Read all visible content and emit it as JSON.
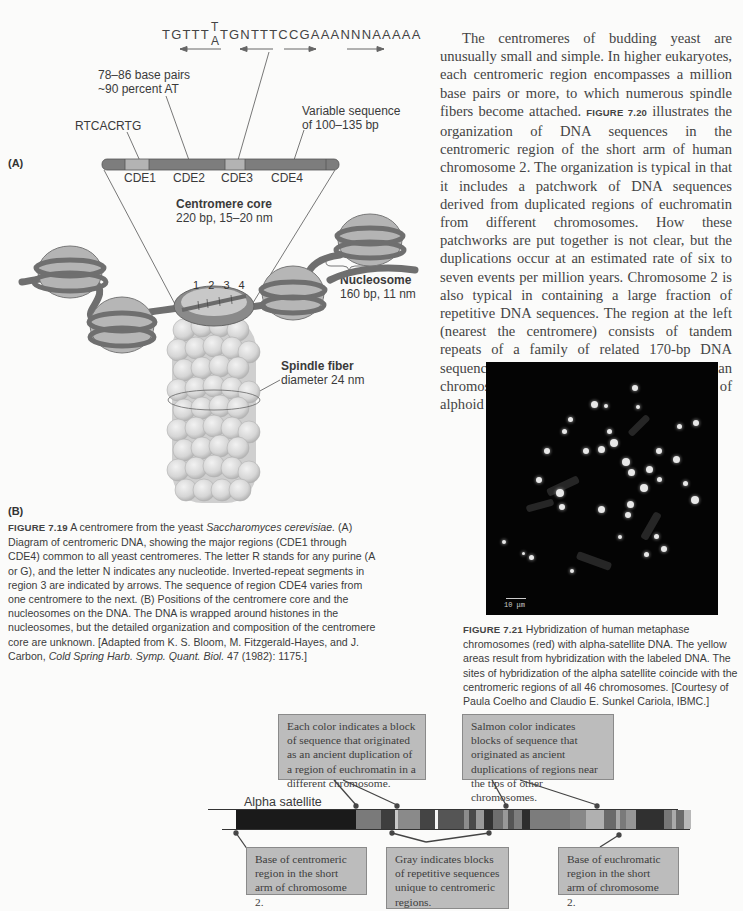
{
  "figure_7_19": {
    "panel_a_tag": "(A)",
    "panel_b_tag": "(B)",
    "sequence": {
      "part1": "TGTTT",
      "stack_top": "T",
      "stack_bottom": "A",
      "part2": "TGNTTTCCGAAANNNAAAAA"
    },
    "labels": {
      "cde2_desc_line1": "78–86 base pairs",
      "cde2_desc_line2": "~90 percent AT",
      "cde1_seq": "RTCACRTG",
      "cde4_desc_line1": "Variable sequence",
      "cde4_desc_line2": "of 100–135 bp"
    },
    "segments": [
      "CDE1",
      "CDE2",
      "CDE3",
      "CDE4"
    ],
    "core": {
      "title": "Centromere core",
      "detail": "220 bp, 15–20 nm"
    },
    "ring_numbers": [
      "1",
      "2",
      "3",
      "4"
    ],
    "nucleosome": {
      "title": "Nucleosome",
      "detail": "160 bp, 11 nm"
    },
    "spindle": {
      "title": "Spindle fiber",
      "detail": "diameter 24 nm"
    },
    "caption": {
      "label": "FIGURE 7.19",
      "text_1": "  A centromere from the yeast ",
      "species": "Saccharomyces cerevisiae.",
      "text_2": " (A) Diagram of centromeric DNA, showing the major regions (CDE1 through CDE4) common to all yeast centromeres. The letter R stands for any purine (A or G), and the letter N indicates any nucleotide. Inverted-repeat segments in region 3 are indicated by arrows. The sequence of region CDE4 varies from one centromere to the next. (B) Positions of the centromere core and the nucleosomes on the DNA. The DNA is wrapped around histones in the nucleosomes, but the detailed organization and composition of the centromere core are unknown. [Adapted from K. S. Bloom, M. Fitzgerald-Hayes, and J. Carbon, ",
      "journal": "Cold Spring Harb. Symp. Quant. Biol.",
      "text_3": " 47 (1982): 1175.]"
    }
  },
  "body": {
    "p1_a": "The centromeres of budding yeast are unusually small and simple. In higher eukaryotes, each centromeric region encompasses a million base pairs or more, to which numerous spindle fibers become attached. ",
    "p1_ref1": "FIGURE 7.20",
    "p1_b": " illustrates the organization of DNA sequences in the centromeric region of the short arm of human chromosome 2. The organization is typical in that it includes a patchwork of DNA sequences derived from duplicated regions of euchromatin from different chromosomes. How these patchworks are put together is not clear, but the duplications occur at an estimated rate of six to seven events per million years. Chromosome 2 is also typical in containing a large fraction of repetitive DNA sequences. The region at the left (nearest the centromere) consists of tandem repeats of a family of related 170-bp DNA sequences called ",
    "p1_term": "alphoid DNA",
    "p1_c": ". Most human chromosomes contain 100–1000 copies of alphoid DNA (",
    "p1_ref2": "FIGURE 7.21",
    "p1_d": "). DNA"
  },
  "figure_7_21": {
    "scale_bar": "10 μm",
    "caption": {
      "label": "FIGURE 7.21",
      "text": "  Hybridization of human metaphase chromosomes (red) with alpha-satellite DNA. The yellow areas result from hybridization with the labeled DNA. The sites of hybridization of the alpha satellite coincide with the centromeric regions of all 46 chromosomes. [Courtesy of Paula Coelho and Claudio E. Sunkel Cariola, IBMC.]"
    }
  },
  "figure_7_20": {
    "track_label": "Alpha satellite",
    "callouts": {
      "each_color": "Each color indicates a block of sequence that originated as an ancient duplication of a region of euchromatin in a different chromosome.",
      "salmon": "Salmon color indicates blocks of sequence that originated as ancient duplications of regions near the tips of other chromosomes.",
      "base_centromeric": "Base of centromeric region in the short arm of chromosome 2.",
      "gray": "Gray indicates blocks of repetitive sequences unique to centromeric regions.",
      "base_euchromatic": "Base of euchromatic region in the short arm of chromosome 2."
    },
    "bar_blocks": [
      {
        "w": 120,
        "c": "#1a1a1a"
      },
      {
        "w": 25,
        "c": "#7a7a7a"
      },
      {
        "w": 14,
        "c": "#3e3e3e"
      },
      {
        "w": 3,
        "c": "#c8c8c8"
      },
      {
        "w": 22,
        "c": "#8a8a8a"
      },
      {
        "w": 15,
        "c": "#444444"
      },
      {
        "w": 3,
        "c": "#f5f5f5"
      },
      {
        "w": 26,
        "c": "#555555"
      },
      {
        "w": 5,
        "c": "#8c8c8c"
      },
      {
        "w": 7,
        "c": "#4a4a4a"
      },
      {
        "w": 8,
        "c": "#9a9a9a"
      },
      {
        "w": 9,
        "c": "#333333"
      },
      {
        "w": 10,
        "c": "#6e6e6e"
      },
      {
        "w": 5,
        "c": "#999999"
      },
      {
        "w": 6,
        "c": "#555555"
      },
      {
        "w": 8,
        "c": "#7d7d7d"
      },
      {
        "w": 8,
        "c": "#2e2e2e"
      },
      {
        "w": 40,
        "c": "#7c7c7c"
      },
      {
        "w": 16,
        "c": "#888888"
      },
      {
        "w": 18,
        "c": "#b0b0b0"
      },
      {
        "w": 12,
        "c": "#6a6a6a"
      },
      {
        "w": 4,
        "c": "#a8a8a8"
      },
      {
        "w": 6,
        "c": "#7a7a7a"
      },
      {
        "w": 10,
        "c": "#969696"
      },
      {
        "w": 28,
        "c": "#303030"
      },
      {
        "w": 8,
        "c": "#777777"
      },
      {
        "w": 4,
        "c": "#aaaaaa"
      },
      {
        "w": 8,
        "c": "#6a6a6a"
      },
      {
        "w": 7,
        "c": "#b8b8b8"
      }
    ]
  }
}
